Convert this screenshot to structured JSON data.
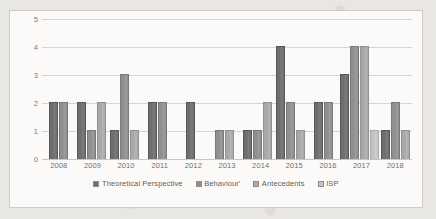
{
  "chart_data": {
    "type": "bar",
    "title": "",
    "xlabel": "",
    "ylabel": "",
    "ylim": [
      0,
      5
    ],
    "yticks": [
      "0",
      "1",
      "2",
      "3",
      "4",
      "5"
    ],
    "grid": true,
    "legend_position": "bottom",
    "categories": [
      "2008",
      "2009",
      "2010",
      "2011",
      "2012",
      "2013",
      "2014",
      "2015",
      "2016",
      "2017",
      "2018"
    ],
    "series": [
      {
        "name": "Theoretical Perspective",
        "color": "#6e6e6e",
        "values": [
          2,
          2,
          1,
          2,
          2,
          0,
          1,
          4,
          2,
          3,
          1
        ]
      },
      {
        "name": "Behaviour'",
        "color": "#8f8f8f",
        "values": [
          2,
          1,
          3,
          2,
          0,
          1,
          1,
          2,
          2,
          4,
          2
        ]
      },
      {
        "name": "Antecedents",
        "color": "#a8a8a8",
        "values": [
          0,
          2,
          1,
          0,
          0,
          1,
          2,
          1,
          0,
          4,
          1
        ]
      },
      {
        "name": "ISP",
        "color": "#c2c2c2",
        "values": [
          0,
          0,
          0,
          0,
          0,
          0,
          0,
          0,
          0,
          1,
          0
        ]
      }
    ]
  },
  "legend": {
    "items": [
      {
        "label": "Theoretical Perspective",
        "color": "#6e6e6e",
        "icon": "legend-swatch-icon"
      },
      {
        "label": "Behaviour'",
        "color": "#8f8f8f",
        "icon": "legend-swatch-icon"
      },
      {
        "label": "Antecedents",
        "color": "#a8a8a8",
        "icon": "legend-swatch-icon"
      },
      {
        "label": "ISP",
        "color": "#c2c2c2",
        "icon": "legend-swatch-icon"
      }
    ]
  }
}
